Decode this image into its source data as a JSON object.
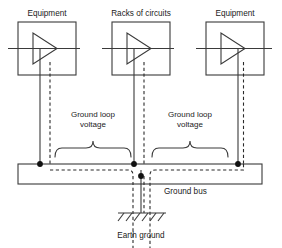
{
  "diagram": {
    "colors": {
      "line": "#3a3a3a",
      "text": "#1b1b1b",
      "background": "#ffffff",
      "node": "#111111"
    },
    "blocks": [
      {
        "id": "left",
        "label": "Equipment",
        "x": 18,
        "y": 22,
        "w": 58,
        "h": 53,
        "symbol": "amplifier-triangle"
      },
      {
        "id": "middle",
        "label": "Racks of circuits",
        "x": 112,
        "y": 22,
        "w": 58,
        "h": 53,
        "symbol": "amplifier-triangle"
      },
      {
        "id": "right",
        "label": "Equipment",
        "x": 206,
        "y": 22,
        "w": 58,
        "h": 53,
        "symbol": "amplifier-triangle"
      }
    ],
    "braces": [
      {
        "id": "left-brace",
        "label_line1": "Ground loop",
        "label_line2": "voltage",
        "x1": 55,
        "x2": 130
      },
      {
        "id": "right-brace",
        "label_line1": "Ground loop",
        "label_line2": "voltage",
        "x1": 152,
        "x2": 228
      }
    ],
    "ground_bus": {
      "label": "Ground bus",
      "x": 18,
      "y": 164,
      "w": 244,
      "h": 20,
      "node_points": [
        40,
        141,
        243
      ]
    },
    "earth_ground": {
      "label": "Earth ground",
      "x": 141,
      "y": 213,
      "hatch_count": 6
    },
    "legend_note": ""
  }
}
